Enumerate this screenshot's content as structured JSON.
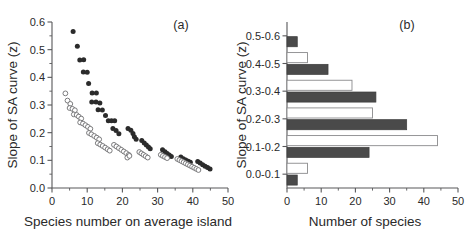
{
  "figure": {
    "background": "#ffffff",
    "width": 472,
    "height": 242
  },
  "panels": [
    {
      "id": "a",
      "label": "(a)"
    },
    {
      "id": "b",
      "label": "(b)"
    }
  ],
  "colors": {
    "filled_marker": "#2b2b2b",
    "open_marker": "#ffffff",
    "open_marker_edge": "#6d6d6f",
    "filled_bar": "#4a4a4a",
    "open_bar": "#ffffff",
    "open_bar_edge": "#8a8a8c",
    "axis": "#58585a",
    "text": "#2a2a2a"
  },
  "chart_data": [
    {
      "type": "scatter",
      "panel": "(a)",
      "title": "",
      "xlabel": "Species number on average island",
      "ylabel": "Slope of SA curve (z)",
      "xlim": [
        0,
        50
      ],
      "ylim": [
        0.0,
        0.6
      ],
      "xticks": [
        0,
        10,
        20,
        30,
        40,
        50
      ],
      "xticklabels": [
        "0",
        "10",
        "20",
        "30",
        "40",
        "50"
      ],
      "yticks": [
        0.0,
        0.1,
        0.2,
        0.3,
        0.4,
        0.5,
        0.6
      ],
      "yticklabels": [
        "0.0",
        "0.1",
        "0.2",
        "0.3",
        "0.4",
        "0.5",
        "0.6"
      ],
      "grid": false,
      "legend": "none",
      "series": [
        {
          "name": "filled-circles",
          "marker": "filled-circle",
          "points": [
            [
              6.0,
              0.566
            ],
            [
              7.2,
              0.512
            ],
            [
              7.9,
              0.463
            ],
            [
              9.0,
              0.464
            ],
            [
              8.9,
              0.419
            ],
            [
              10.0,
              0.418
            ],
            [
              10.4,
              0.378
            ],
            [
              11.4,
              0.343
            ],
            [
              12.6,
              0.343
            ],
            [
              11.3,
              0.311
            ],
            [
              12.5,
              0.311
            ],
            [
              13.6,
              0.307
            ],
            [
              13.1,
              0.283
            ],
            [
              14.3,
              0.282
            ],
            [
              15.2,
              0.262
            ],
            [
              16.0,
              0.243
            ],
            [
              16.9,
              0.243
            ],
            [
              17.8,
              0.243
            ],
            [
              17.3,
              0.215
            ],
            [
              18.2,
              0.208
            ],
            [
              19.0,
              0.196
            ],
            [
              21.6,
              0.215
            ],
            [
              22.4,
              0.209
            ],
            [
              23.0,
              0.197
            ],
            [
              23.4,
              0.185
            ],
            [
              23.9,
              0.176
            ],
            [
              25.5,
              0.172
            ],
            [
              26.2,
              0.163
            ],
            [
              26.8,
              0.155
            ],
            [
              27.4,
              0.148
            ],
            [
              27.9,
              0.142
            ],
            [
              31.4,
              0.138
            ],
            [
              32.1,
              0.131
            ],
            [
              32.7,
              0.125
            ],
            [
              33.3,
              0.119
            ],
            [
              33.9,
              0.114
            ],
            [
              36.6,
              0.112
            ],
            [
              37.3,
              0.106
            ],
            [
              38.0,
              0.101
            ],
            [
              38.7,
              0.097
            ],
            [
              39.3,
              0.093
            ],
            [
              41.4,
              0.096
            ],
            [
              42.1,
              0.09
            ],
            [
              42.8,
              0.084
            ],
            [
              43.5,
              0.079
            ],
            [
              44.2,
              0.074
            ],
            [
              44.9,
              0.069
            ]
          ]
        },
        {
          "name": "open-circles",
          "marker": "open-circle",
          "points": [
            [
              3.8,
              0.342
            ],
            [
              4.4,
              0.316
            ],
            [
              5.2,
              0.304
            ],
            [
              5.0,
              0.289
            ],
            [
              5.8,
              0.286
            ],
            [
              6.5,
              0.281
            ],
            [
              6.2,
              0.266
            ],
            [
              7.0,
              0.264
            ],
            [
              7.6,
              0.258
            ],
            [
              8.3,
              0.251
            ],
            [
              8.0,
              0.237
            ],
            [
              8.8,
              0.233
            ],
            [
              9.5,
              0.227
            ],
            [
              10.2,
              0.221
            ],
            [
              10.9,
              0.214
            ],
            [
              10.5,
              0.199
            ],
            [
              11.2,
              0.194
            ],
            [
              12.0,
              0.188
            ],
            [
              12.7,
              0.182
            ],
            [
              13.4,
              0.176
            ],
            [
              13.0,
              0.162
            ],
            [
              13.7,
              0.157
            ],
            [
              14.4,
              0.152
            ],
            [
              15.1,
              0.146
            ],
            [
              15.8,
              0.14
            ],
            [
              16.4,
              0.135
            ],
            [
              17.6,
              0.156
            ],
            [
              18.3,
              0.15
            ],
            [
              19.0,
              0.144
            ],
            [
              19.7,
              0.138
            ],
            [
              20.4,
              0.132
            ],
            [
              21.1,
              0.126
            ],
            [
              21.8,
              0.12
            ],
            [
              21.4,
              0.11
            ],
            [
              22.0,
              0.116
            ],
            [
              24.8,
              0.13
            ],
            [
              25.4,
              0.125
            ],
            [
              26.0,
              0.12
            ],
            [
              26.6,
              0.115
            ],
            [
              27.2,
              0.11
            ],
            [
              30.9,
              0.12
            ],
            [
              31.5,
              0.116
            ],
            [
              32.1,
              0.112
            ],
            [
              32.7,
              0.108
            ],
            [
              35.6,
              0.105
            ],
            [
              36.2,
              0.101
            ],
            [
              36.8,
              0.097
            ],
            [
              37.4,
              0.093
            ],
            [
              38.0,
              0.089
            ],
            [
              38.6,
              0.085
            ],
            [
              39.2,
              0.081
            ],
            [
              39.8,
              0.077
            ],
            [
              40.4,
              0.073
            ],
            [
              41.0,
              0.069
            ],
            [
              41.6,
              0.065
            ]
          ]
        }
      ]
    },
    {
      "type": "bar",
      "orientation": "horizontal",
      "panel": "(b)",
      "title": "",
      "xlabel": "Number of species",
      "ylabel": "Slope of SA curve (z)",
      "xlim": [
        0,
        50
      ],
      "xticks": [
        0,
        10,
        20,
        30,
        40,
        50
      ],
      "xticklabels": [
        "0",
        "10",
        "20",
        "30",
        "40",
        "50"
      ],
      "categories": [
        "0.0-0.1",
        "0.1-0.2",
        "0.2-0.3",
        "0.3-0.4",
        "0.4-0.5",
        "0.5-0.6"
      ],
      "grid": false,
      "legend": "none",
      "series": [
        {
          "name": "open-bars",
          "fill": "open",
          "values": [
            6,
            44,
            25,
            19,
            6,
            0
          ]
        },
        {
          "name": "filled-bars",
          "fill": "filled",
          "values": [
            3,
            24,
            35,
            26,
            12,
            3
          ]
        }
      ]
    }
  ]
}
